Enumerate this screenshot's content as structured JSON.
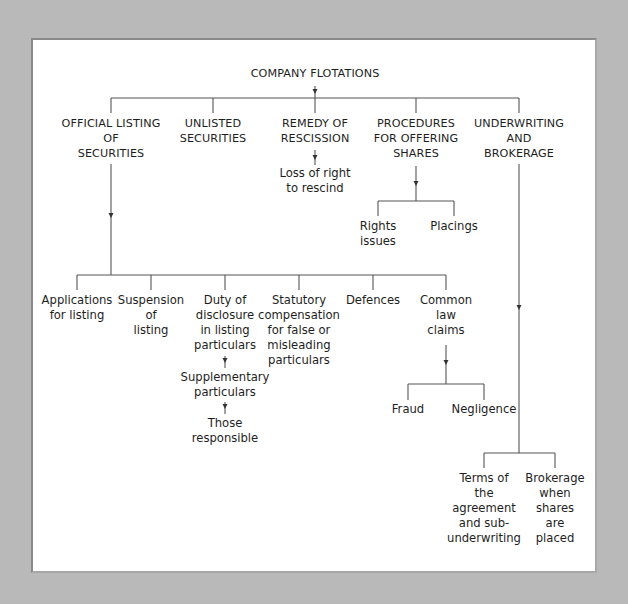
{
  "diagram": {
    "root": {
      "label": "COMPANY FLOTATIONS"
    },
    "level1": [
      {
        "id": "official",
        "label": "OFFICIAL LISTING\nOF\nSECURITIES"
      },
      {
        "id": "unlisted",
        "label": "UNLISTED\nSECURITIES"
      },
      {
        "id": "rescission",
        "label": "REMEDY OF\nRESCISSION"
      },
      {
        "id": "procedures",
        "label": "PROCEDURES\nFOR OFFERING\nSHARES"
      },
      {
        "id": "underwriting",
        "label": "UNDERWRITING\nAND\nBROKERAGE"
      }
    ],
    "rescission_children": [
      {
        "label": "Loss of right\nto rescind"
      }
    ],
    "procedures_children": [
      {
        "label": "Rights\nissues"
      },
      {
        "label": "Placings"
      }
    ],
    "official_children": [
      {
        "label": "Applications\nfor listing"
      },
      {
        "label": "Suspension\nof\nlisting"
      },
      {
        "label": "Duty of\ndisclosure\nin listing\nparticulars"
      },
      {
        "label": "Statutory\ncompensation\nfor false or\nmisleading\nparticulars"
      },
      {
        "label": "Defences"
      },
      {
        "label": "Common\nlaw\nclaims"
      }
    ],
    "disclosure_chain": [
      {
        "label": "Supplementary\nparticulars"
      },
      {
        "label": "Those\nresponsible"
      }
    ],
    "common_law_children": [
      {
        "label": "Fraud"
      },
      {
        "label": "Negligence"
      }
    ],
    "underwriting_children": [
      {
        "label": "Terms of\nthe\nagreement\nand sub-\nunderwriting"
      },
      {
        "label": "Brokerage\nwhen\nshares\nare\nplaced"
      }
    ]
  },
  "colors": {
    "background": "#b9b9b9",
    "panel": "#ffffff",
    "line": "#555555",
    "text": "#1e1e1e"
  }
}
